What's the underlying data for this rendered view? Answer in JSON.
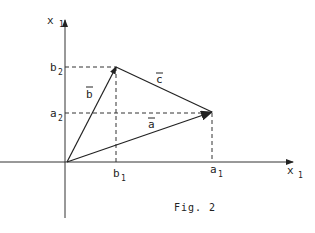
{
  "figure": {
    "caption": "Fig. 2",
    "axes": {
      "x_label": "x",
      "x_sub": "1",
      "y_label": "x",
      "y_sub": "1"
    },
    "ticks": {
      "b2": {
        "label": "b",
        "sub": "2"
      },
      "a2": {
        "label": "a",
        "sub": "2"
      },
      "b1": {
        "label": "b",
        "sub": "1"
      },
      "a1": {
        "label": "a",
        "sub": "1"
      }
    },
    "vectors": {
      "a": {
        "label": "a",
        "from": [
          0,
          0
        ],
        "to": [
          "a1",
          "a2"
        ]
      },
      "b": {
        "label": "b",
        "from": [
          0,
          0
        ],
        "to": [
          "b1",
          "b2"
        ]
      },
      "c": {
        "label": "c",
        "from": [
          "b1",
          "b2"
        ],
        "to": [
          "a1",
          "a2"
        ]
      }
    },
    "color": "#222222"
  }
}
